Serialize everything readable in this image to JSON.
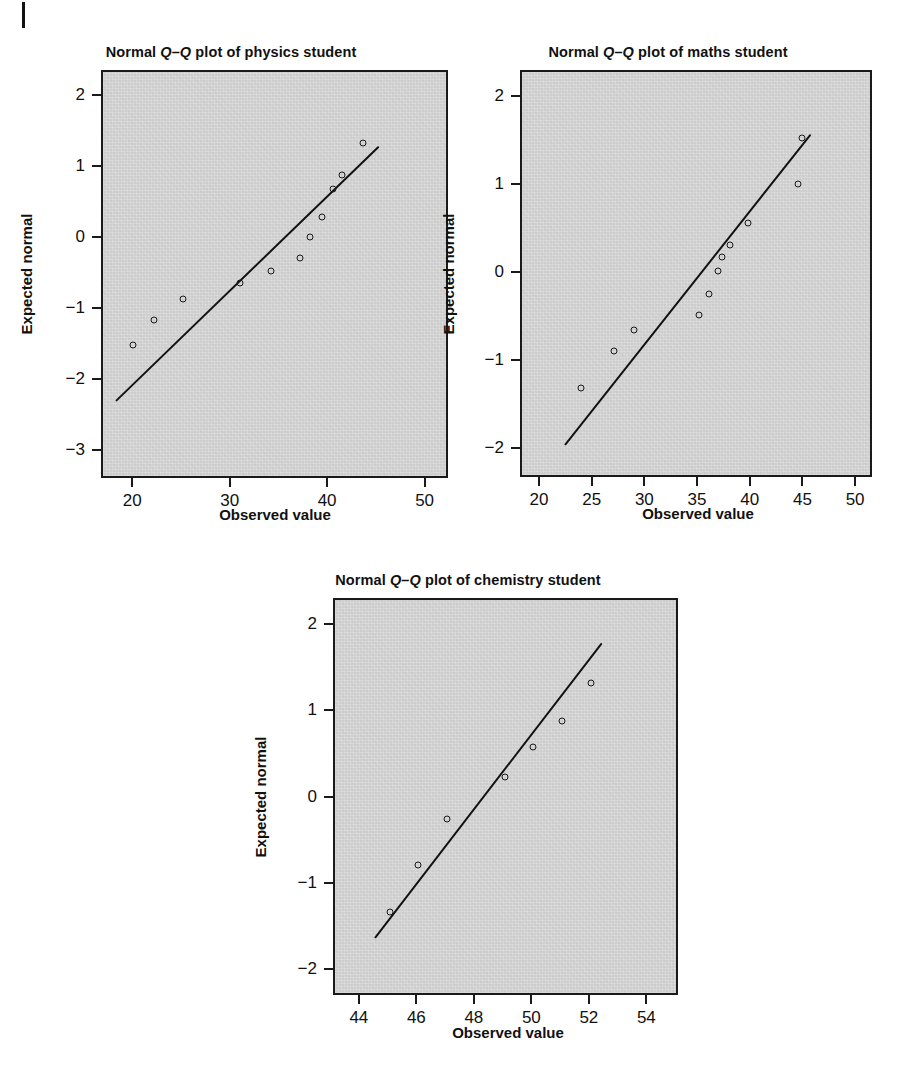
{
  "page": {
    "margin_mark": "page-margin-rule"
  },
  "chart_data": [
    {
      "id": "physics",
      "type": "scatter",
      "title": "Normal Q–Q plot of physics student",
      "title_parts": {
        "pre": "Normal ",
        "ital": "Q–Q",
        "post": " plot of physics student"
      },
      "xlabel": "Observed value",
      "ylabel": "Expected normal",
      "xlim": [
        16.8,
        52.4
      ],
      "ylim": [
        -3.4,
        2.35
      ],
      "xticks": [
        20,
        30,
        40,
        50
      ],
      "xtick_labels": [
        "20",
        "30",
        "40",
        "50"
      ],
      "yticks": [
        2,
        1,
        0,
        -1,
        -2,
        -3
      ],
      "ytick_labels": [
        "2",
        "1",
        "0",
        "−1",
        "−2",
        "−3"
      ],
      "grid": false,
      "legend": "none",
      "points": [
        {
          "x": 19.9,
          "y": -1.5
        },
        {
          "x": 22.0,
          "y": -1.15
        },
        {
          "x": 25.0,
          "y": -0.85
        },
        {
          "x": 30.9,
          "y": -0.63
        },
        {
          "x": 34.0,
          "y": -0.45
        },
        {
          "x": 37.0,
          "y": -0.27
        },
        {
          "x": 38.0,
          "y": 0.02
        },
        {
          "x": 39.3,
          "y": 0.3
        },
        {
          "x": 40.4,
          "y": 0.7
        },
        {
          "x": 41.3,
          "y": 0.9
        },
        {
          "x": 43.5,
          "y": 1.35
        }
      ],
      "fitline": {
        "x1": 18.1,
        "y1": -2.27,
        "x2": 45.1,
        "y2": 1.32
      }
    },
    {
      "id": "maths",
      "type": "scatter",
      "title": "Normal Q–Q plot of maths student",
      "title_parts": {
        "pre": "Normal ",
        "ital": "Q–Q",
        "post": " plot of maths student"
      },
      "xlabel": "Observed value",
      "ylabel": "Expected normal",
      "xlim": [
        18.2,
        51.6
      ],
      "ylim": [
        -2.33,
        2.3
      ],
      "xticks": [
        20,
        25,
        30,
        35,
        40,
        45,
        50
      ],
      "xtick_labels": [
        "20",
        "25",
        "30",
        "35",
        "40",
        "45",
        "50"
      ],
      "yticks": [
        2,
        1,
        0,
        -1,
        -2
      ],
      "ytick_labels": [
        "2",
        "1",
        "0",
        "−1",
        "−2"
      ],
      "grid": false,
      "legend": "none",
      "points": [
        {
          "x": 23.8,
          "y": -1.3
        },
        {
          "x": 26.9,
          "y": -0.87
        },
        {
          "x": 28.8,
          "y": -0.64
        },
        {
          "x": 35.0,
          "y": -0.46
        },
        {
          "x": 35.9,
          "y": -0.22
        },
        {
          "x": 36.8,
          "y": 0.04
        },
        {
          "x": 37.2,
          "y": 0.2
        },
        {
          "x": 37.9,
          "y": 0.33
        },
        {
          "x": 39.6,
          "y": 0.58
        },
        {
          "x": 44.4,
          "y": 1.03
        },
        {
          "x": 44.8,
          "y": 1.55
        }
      ],
      "fitline": {
        "x1": 22.3,
        "y1": -1.93,
        "x2": 45.6,
        "y2": 1.6
      }
    },
    {
      "id": "chemistry",
      "type": "scatter",
      "title": "Normal Q–Q plot of chemistry student",
      "title_parts": {
        "pre": "Normal ",
        "ital": "Q–Q",
        "post": " plot of chemistry student"
      },
      "xlabel": "Observed value",
      "ylabel": "Expected normal",
      "xlim": [
        43.1,
        55.1
      ],
      "ylim": [
        -2.3,
        2.3
      ],
      "xticks": [
        44,
        46,
        48,
        50,
        52,
        54
      ],
      "xtick_labels": [
        "44",
        "46",
        "48",
        "50",
        "52",
        "54"
      ],
      "yticks": [
        2,
        1,
        0,
        -1,
        -2
      ],
      "ytick_labels": [
        "2",
        "1",
        "0",
        "−1",
        "−2"
      ],
      "grid": false,
      "legend": "none",
      "points": [
        {
          "x": 45.0,
          "y": -1.32
        },
        {
          "x": 46.0,
          "y": -0.77
        },
        {
          "x": 47.0,
          "y": -0.24
        },
        {
          "x": 49.0,
          "y": 0.25
        },
        {
          "x": 50.0,
          "y": 0.6
        },
        {
          "x": 51.0,
          "y": 0.9
        },
        {
          "x": 52.0,
          "y": 1.34
        }
      ],
      "fitline": {
        "x1": 44.5,
        "y1": -1.6,
        "x2": 52.4,
        "y2": 1.82
      }
    }
  ]
}
